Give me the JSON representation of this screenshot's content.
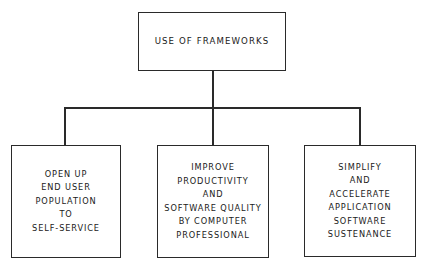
{
  "diagram": {
    "type": "hierarchy",
    "root": {
      "label": "USE OF FRAMEWORKS"
    },
    "children": [
      {
        "lines": [
          "OPEN UP",
          "END USER",
          "POPULATION",
          "TO",
          "SELF-SERVICE"
        ]
      },
      {
        "lines": [
          "IMPROVE",
          "PRODUCTIVITY",
          "AND",
          "SOFTWARE QUALITY",
          "BY COMPUTER",
          "PROFESSIONAL"
        ]
      },
      {
        "lines": [
          "SIMPLIFY",
          "AND",
          "ACCELERATE",
          "APPLICATION",
          "SOFTWARE",
          "SUSTENANCE"
        ]
      }
    ],
    "colors": {
      "line": "#2a2a2a",
      "background": "#ffffff",
      "text": "#1a1a1a"
    }
  }
}
